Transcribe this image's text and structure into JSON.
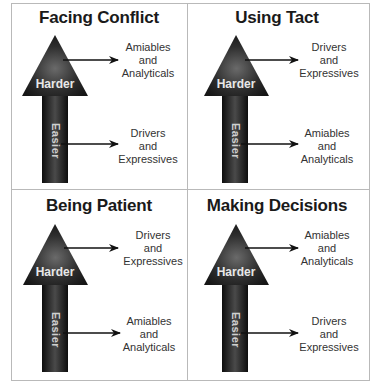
{
  "panels": [
    {
      "title": "Facing Conflict",
      "top_label": [
        "Amiables",
        "and",
        "Analyticals"
      ],
      "bottom_label": [
        "Drivers",
        "and",
        "Expressives"
      ]
    },
    {
      "title": "Using Tact",
      "top_label": [
        "Drivers",
        "and",
        "Expressives"
      ],
      "bottom_label": [
        "Amiables",
        "and",
        "Analyticals"
      ]
    },
    {
      "title": "Being Patient",
      "top_label": [
        "Drivers",
        "and",
        "Expressives"
      ],
      "bottom_label": [
        "Amiables",
        "and",
        "Analyticals"
      ]
    },
    {
      "title": "Making Decisions",
      "top_label": [
        "Amiables",
        "and",
        "Analyticals"
      ],
      "bottom_label": [
        "Drivers",
        "and",
        "Expressives"
      ]
    }
  ],
  "arrow": {
    "head_label": "Harder",
    "shaft_label": "Easier"
  },
  "colors": {
    "border": "#b9b9b9",
    "arrow_dark": "#111111",
    "arrow_mid": "#555555",
    "text": "#333333"
  }
}
